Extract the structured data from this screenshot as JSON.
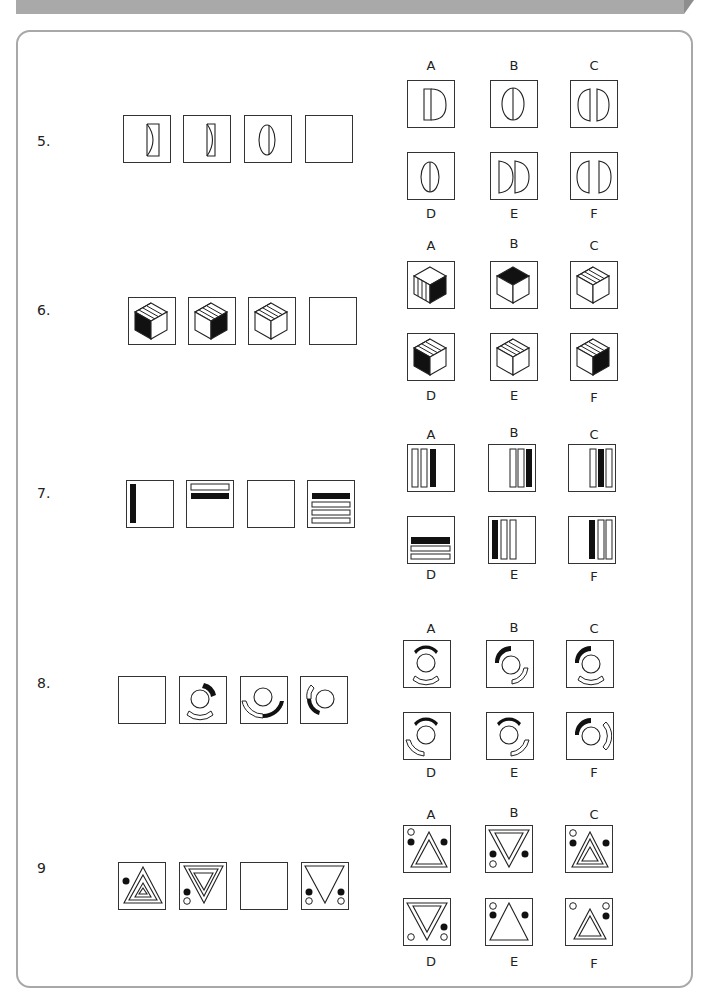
{
  "questions": [
    {
      "number": "5.",
      "sequence": [
        "split-lens-a",
        "split-lens-b",
        "split-lens-c",
        "blank"
      ],
      "options": [
        "A",
        "B",
        "C",
        "D",
        "E",
        "F"
      ]
    },
    {
      "number": "6.",
      "sequence": [
        "cube-black-left",
        "cube-black-right",
        "cube-white",
        "blank"
      ],
      "options": [
        "A",
        "B",
        "C",
        "D",
        "E",
        "F"
      ]
    },
    {
      "number": "7.",
      "sequence": [
        "bars-1",
        "bars-2",
        "blank",
        "bars-4"
      ],
      "options": [
        "A",
        "B",
        "C",
        "D",
        "E",
        "F"
      ]
    },
    {
      "number": "8.",
      "sequence": [
        "blank",
        "ring-1",
        "ring-2",
        "ring-3"
      ],
      "options": [
        "A",
        "B",
        "C",
        "D",
        "E",
        "F"
      ]
    },
    {
      "number": "9",
      "sequence": [
        "tri-1",
        "tri-2",
        "blank",
        "tri-4"
      ],
      "options": [
        "A",
        "B",
        "C",
        "D",
        "E",
        "F"
      ]
    }
  ]
}
